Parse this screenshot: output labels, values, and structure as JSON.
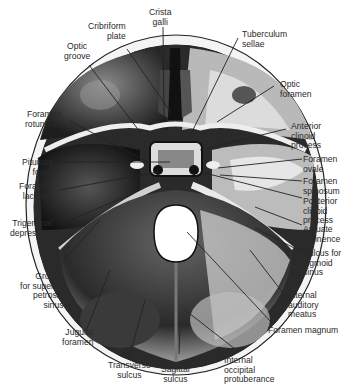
{
  "figure": {
    "colors": {
      "background": "#ffffff",
      "bone_dark": "#1a1a1a",
      "bone_mid": "#6e6e6e",
      "bone_light": "#d8d8d8",
      "rim": "#f2f2f2",
      "leader_line": "#222222",
      "label_text": "#2a2a2a"
    }
  },
  "labels": {
    "crista_galli": "Crista\ngalli",
    "cribriform_plate": "Cribriform\nplate",
    "tuberculum_sellae": "Tuberculum\nsellae",
    "optic_groove": "Optic\ngroove",
    "optic_foramen": "Optic\nforamen",
    "foramen_rotundum": "Foramen\nrotundum",
    "anterior_clinoid_process": "Anterior\nclinoid\nprocess",
    "pituitary_fossa": "Pituitary\nfossa",
    "foramen_ovale": "Foramen\novale",
    "foramen_lacerum": "Foramen\nlacerum",
    "foramen_spinosum": "Foramen\nspinosum",
    "posterior_clinoid_process": "Posterior\nclinoid\nprocess",
    "trigeminal_depression": "Trigeminal\ndepression",
    "arcuate_eminence": "Arcuate\neminence",
    "sulcus_sigmoid_sinus": "Sulcus for\nsigmoid\nsinus",
    "groove_superior_petrosal_sinus": "Groove\nfor superior\npetrosal\nsinus",
    "internal_auditory_meatus": "Internal\nauditory\nmeatus",
    "jugular_foramen": "Jugular\nforamen",
    "foramen_magnum": "Foramen magnum",
    "transverse_sulcus": "Transverse\nsulcus",
    "sagittal_sulcus": "Sagittal\nsulcus",
    "internal_occipital_protuberance": "Internal\noccipital\nprotuberance"
  }
}
